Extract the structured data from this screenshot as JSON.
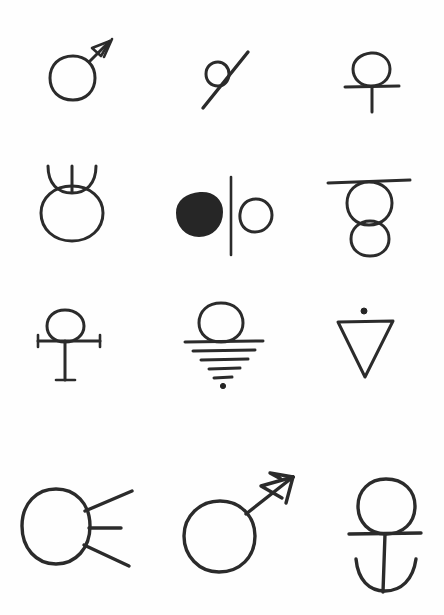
{
  "page": {
    "background_color": "#fefefe",
    "ink_color": "#2b2b2b",
    "width": 444,
    "height": 615,
    "grid": {
      "rows": 4,
      "columns": 3
    }
  },
  "symbols": [
    {
      "id": "r1c1",
      "row": 1,
      "column": 1,
      "name": "mars-symbol-small",
      "description": "Circle with a single arrow pointing up and to the right",
      "parts": "circle, arrow shaft, arrowhead"
    },
    {
      "id": "r1c2",
      "row": 1,
      "column": 2,
      "name": "circle-with-diagonal-slash",
      "description": "Small open circle crossed by a long diagonal line running lower-left to upper-right",
      "parts": "small circle, diagonal stroke"
    },
    {
      "id": "r1c3",
      "row": 1,
      "column": 3,
      "name": "ankh-cross-symbol",
      "description": "Open circle resting on a plain cross with a short vertical stem",
      "parts": "circle, horizontal bar, vertical stem"
    },
    {
      "id": "r2c1",
      "row": 2,
      "column": 1,
      "name": "taurus-horned-circle-symbol",
      "description": "Large circle topped by an upturned horn arc with a vertical line through its middle",
      "parts": "circle, horn arc, center stroke"
    },
    {
      "id": "r2c2",
      "row": 2,
      "column": 2,
      "name": "filled-and-open-circle-divided",
      "description": "Solid filled blob on the left and an open circle on the right, separated by a tall vertical divider line",
      "parts": "filled circle, vertical divider, open circle"
    },
    {
      "id": "r2c3",
      "row": 2,
      "column": 3,
      "name": "bar-over-stacked-circles",
      "description": "Horizontal bar above a large circle with a smaller circle hanging beneath it",
      "parts": "horizontal bar, large circle, small circle"
    },
    {
      "id": "r3c1",
      "row": 3,
      "column": 1,
      "name": "circle-on-serif-cross",
      "description": "Small circle on a cross whose horizontal bar and foot end in short serif ticks",
      "parts": "circle, serif crossbar, stem with serif foot"
    },
    {
      "id": "r3c2",
      "row": 3,
      "column": 2,
      "name": "circle-over-tapering-lines",
      "description": "Circle sitting on a stack of progressively shorter horizontal lines ending in a dot",
      "parts": "circle, five tapering lines, terminal dot"
    },
    {
      "id": "r3c3",
      "row": 3,
      "column": 3,
      "name": "inverted-triangle-with-dot",
      "description": "Downward-pointing open triangle with a single dot centered above it",
      "parts": "inverted triangle, dot"
    },
    {
      "id": "r4c1",
      "row": 4,
      "column": 1,
      "name": "circle-with-three-rays",
      "description": "Large circle with three straight rays radiating to the right",
      "parts": "circle, upper ray, middle ray, lower ray"
    },
    {
      "id": "r4c2",
      "row": 4,
      "column": 2,
      "name": "mars-symbol-large-double-barb",
      "description": "Large circle with a long arrow pointing up and to the right, drawn with a double-barbed arrowhead",
      "parts": "circle, arrow shaft, two barbs"
    },
    {
      "id": "r4c3",
      "row": 4,
      "column": 3,
      "name": "circle-over-anchor",
      "description": "Circle above a horizontal bar with a vertical stem descending into a curved anchor arc",
      "parts": "circle, horizontal bar, stem, anchor arc"
    }
  ]
}
